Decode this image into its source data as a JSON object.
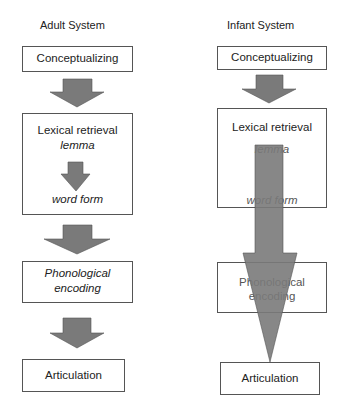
{
  "diagram": {
    "arrow_color": "#7a7a7a",
    "adult": {
      "title": "Adult System",
      "conceptualizing": "Conceptualizing",
      "lexical_retrieval": "Lexical retrieval",
      "lemma": "lemma",
      "word_form": "word form",
      "phonological_line1": "Phonological",
      "phonological_line2": "encoding",
      "articulation": "Articulation"
    },
    "infant": {
      "title": "Infant System",
      "conceptualizing": "Conceptualizing",
      "lexical_retrieval": "Lexical retrieval",
      "lemma": "lemma",
      "word_form": "word form",
      "phonological_line1": "Phonological",
      "phonological_line2": "encoding",
      "articulation": "Articulation"
    }
  }
}
